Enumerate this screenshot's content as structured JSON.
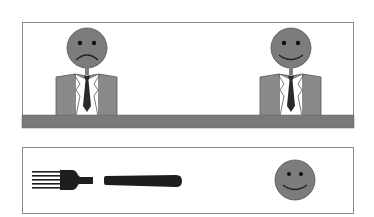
{
  "scenes": {
    "top": {
      "description": "Two men in suits seated behind a desk: left frowning, right smiling",
      "figures": [
        {
          "id": "left-person",
          "expression": "frown",
          "head_cx": 87,
          "head_cy": 48
        },
        {
          "id": "right-person",
          "expression": "smile",
          "head_cx": 291,
          "head_cy": 48
        }
      ],
      "desk_color": "#7a7a7a"
    },
    "bottom": {
      "description": "A fork, a knife handle, and a smiling face",
      "items": [
        {
          "id": "fork",
          "icon": "fork-icon"
        },
        {
          "id": "knife",
          "icon": "knife-icon"
        },
        {
          "id": "smiley",
          "icon": "smiley-face-icon",
          "expression": "smile"
        }
      ]
    }
  },
  "colors": {
    "face": "#7c7c7c",
    "suit": "#8a8a8a",
    "tie": "#2a2a2a",
    "utensil": "#1e1e1e",
    "border": "#8a8a8a",
    "desk": "#7a7a7a"
  }
}
